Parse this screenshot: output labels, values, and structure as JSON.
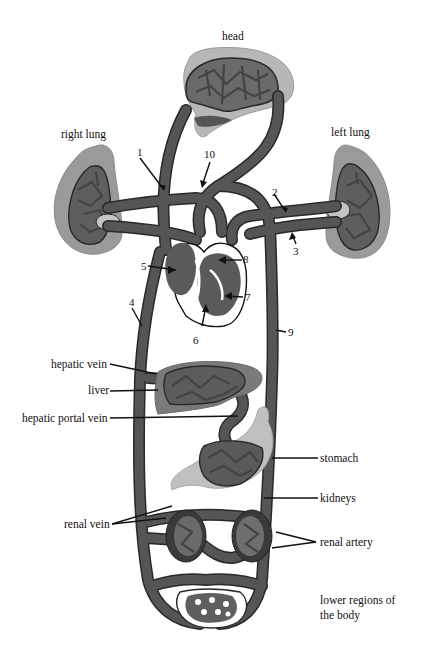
{
  "diagram": {
    "colors": {
      "vessel": "#5a5a5a",
      "vessel_outline": "#2a2a2a",
      "organ_tissue": "#8a8a8a",
      "organ_light": "#bdbdbd",
      "capillary_gaps": "#cfcfcf",
      "background": "#ffffff",
      "text": "#111111"
    },
    "organs": {
      "head": "head",
      "right_lung": "right lung",
      "left_lung": "left lung",
      "hepatic_vein": "hepatic vein",
      "liver": "liver",
      "hepatic_portal_vein": "hepatic portal vein",
      "stomach": "stomach",
      "kidneys": "kidneys",
      "renal_vein": "renal vein",
      "renal_artery": "renal artery",
      "lower_regions_line1": "lower regions of",
      "lower_regions_line2": "the body"
    },
    "numbered_labels": [
      "1",
      "2",
      "3",
      "4",
      "5",
      "6",
      "7",
      "8",
      "9",
      "10"
    ]
  }
}
